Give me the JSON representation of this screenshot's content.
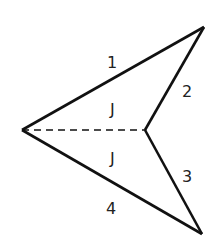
{
  "diagram": {
    "type": "kite-dart (concave quadrilateral) split by dashed diagonal",
    "vertices": {
      "left": [
        22,
        130
      ],
      "top": [
        204,
        27
      ],
      "inner": [
        145,
        130
      ],
      "bottom": [
        202,
        234
      ]
    },
    "side_labels": [
      "1",
      "2",
      "3",
      "4"
    ],
    "angle_labels": [
      "J",
      "J"
    ],
    "colors": {
      "stroke": "#111111",
      "text": "#222222"
    }
  }
}
